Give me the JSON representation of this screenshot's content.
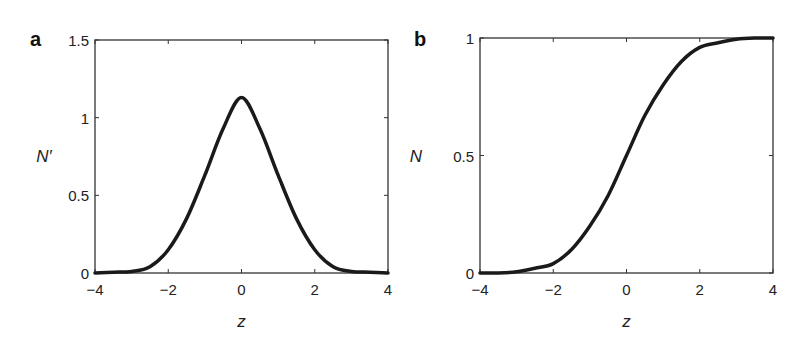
{
  "chart_data": [
    {
      "panel": "a",
      "type": "line",
      "title": "",
      "xlabel": "z",
      "ylabel": "N′",
      "xlim": [
        -4,
        4
      ],
      "ylim": [
        0,
        1.5
      ],
      "xticks": [
        -4,
        -2,
        0,
        2,
        4
      ],
      "xtick_labels": [
        "−4",
        "−2",
        "0",
        "2",
        "4"
      ],
      "yticks": [
        0,
        0.5,
        1,
        1.5
      ],
      "ytick_labels": [
        "0",
        "0.5",
        "1",
        "1.5"
      ],
      "grid": false,
      "series": [
        {
          "name": "N'",
          "x": [
            -4,
            -3.5,
            -3,
            -2.5,
            -2,
            -1.5,
            -1,
            -0.5,
            0,
            0.5,
            1,
            1.5,
            2,
            2.5,
            3,
            3.5,
            4
          ],
          "y": [
            0.0,
            0.005,
            0.01,
            0.04,
            0.15,
            0.35,
            0.63,
            0.93,
            1.13,
            0.93,
            0.63,
            0.35,
            0.15,
            0.04,
            0.01,
            0.005,
            0.0
          ]
        }
      ]
    },
    {
      "panel": "b",
      "type": "line",
      "title": "",
      "xlabel": "z",
      "ylabel": "N",
      "xlim": [
        -4,
        4
      ],
      "ylim": [
        0,
        1
      ],
      "xticks": [
        -4,
        -2,
        0,
        2,
        4
      ],
      "xtick_labels": [
        "−4",
        "−2",
        "0",
        "2",
        "4"
      ],
      "yticks": [
        0,
        0.5,
        1
      ],
      "ytick_labels": [
        "0",
        "0.5",
        "1"
      ],
      "grid": false,
      "series": [
        {
          "name": "N",
          "x": [
            -4,
            -3.5,
            -3,
            -2.5,
            -2,
            -1.5,
            -1,
            -0.5,
            0,
            0.5,
            1,
            1.5,
            2,
            2.5,
            3,
            3.5,
            4
          ],
          "y": [
            0.0,
            0.0,
            0.005,
            0.02,
            0.04,
            0.1,
            0.2,
            0.33,
            0.5,
            0.67,
            0.8,
            0.9,
            0.96,
            0.98,
            0.995,
            1.0,
            1.0
          ]
        }
      ]
    }
  ],
  "panels": {
    "a": {
      "letter": "a",
      "ylabel": "N′",
      "xlabel": "z"
    },
    "b": {
      "letter": "b",
      "ylabel": "N",
      "xlabel": "z"
    }
  }
}
